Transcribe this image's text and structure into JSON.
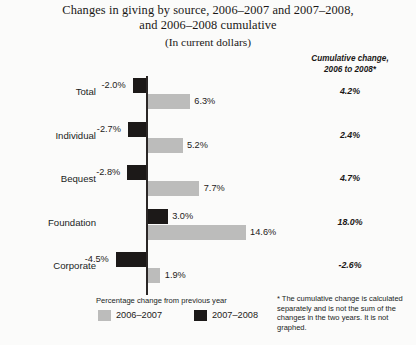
{
  "title": {
    "line1": "Changes in giving by source, 2006–2007 and 2007–2008,",
    "line2": "and 2006–2008 cumulative",
    "subtitle": "(In current dollars)"
  },
  "cumulative_header": {
    "line1": "Cumulative change,",
    "line2": "2006 to 2008*"
  },
  "legend": {
    "title": "Percentage change from previous year",
    "items": [
      {
        "label": "2006–2007",
        "color": "#bcbcbb",
        "swatch": "gray"
      },
      {
        "label": "2007–2008",
        "color": "#1c1918",
        "swatch": "black"
      }
    ]
  },
  "footnote": "* The cumulative change is calculated separately and is not the sum of the changes in the two years. It is not graphed.",
  "rows": [
    {
      "label": "Total",
      "v0708_label": "-2.0%",
      "v0607_label": "6.3%",
      "cumulative_label": "4.2%"
    },
    {
      "label": "Individual",
      "v0708_label": "-2.7%",
      "v0607_label": "5.2%",
      "cumulative_label": "2.4%"
    },
    {
      "label": "Bequest",
      "v0708_label": "-2.8%",
      "v0607_label": "7.7%",
      "cumulative_label": "4.7%"
    },
    {
      "label": "Foundation",
      "v0708_label": "3.0%",
      "v0607_label": "14.6%",
      "cumulative_label": "18.0%"
    },
    {
      "label": "Corporate",
      "v0708_label": "-4.5%",
      "v0607_label": "1.9%",
      "cumulative_label": "-2.6%"
    }
  ],
  "chart_data": {
    "type": "bar",
    "title": "Changes in giving by source, 2006–2007 and 2007–2008, and 2006–2008 cumulative",
    "subtitle": "(In current dollars)",
    "orientation": "horizontal",
    "categories": [
      "Total",
      "Individual",
      "Bequest",
      "Foundation",
      "Corporate"
    ],
    "series": [
      {
        "name": "2006–2007",
        "color": "#bcbcbb",
        "values": [
          6.3,
          5.2,
          7.7,
          14.6,
          1.9
        ]
      },
      {
        "name": "2007–2008",
        "color": "#1c1918",
        "values": [
          -2.0,
          -2.7,
          -2.8,
          3.0,
          -4.5
        ]
      }
    ],
    "annotations": [
      {
        "name": "Cumulative change, 2006 to 2008*",
        "values": [
          4.2,
          2.4,
          4.7,
          18.0,
          -2.6
        ],
        "graphed": false
      }
    ],
    "xlabel": "Percentage change from previous year",
    "ylabel": "",
    "xlim": [
      -5,
      16
    ],
    "grid": false,
    "legend_position": "bottom-left",
    "units": "percent"
  }
}
